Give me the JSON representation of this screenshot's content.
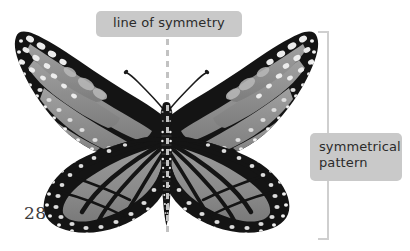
{
  "page": {
    "number": "28",
    "background_color": "#ffffff"
  },
  "illustration": {
    "subject": "monarch-butterfly",
    "description": "Top-down photograph of a monarch butterfly with wings spread, shown in greyscale",
    "colors": {
      "wing_dark": "#171717",
      "wing_panel": "#8f8f8f",
      "wing_spot": "#e8e8e8",
      "body": "#111111"
    }
  },
  "annotations": {
    "symmetry_line": {
      "label": "line of symmetry",
      "style": "dashed",
      "color": "#c2c2c2",
      "box_color": "#c9c9c9",
      "text_color": "#2b2b2b"
    },
    "pattern": {
      "label": "symmetrical\npattern",
      "bracket_color": "#cfcfcf",
      "box_color": "#c9c9c9",
      "text_color": "#2b2b2b"
    }
  }
}
